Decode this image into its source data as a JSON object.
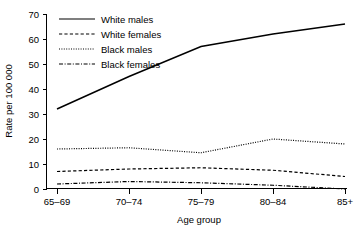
{
  "chart_data": {
    "type": "line",
    "title": "",
    "xlabel": "Age group",
    "ylabel": "Rate per 100 000",
    "categories": [
      "65–69",
      "70–74",
      "75–79",
      "80–84",
      "85+"
    ],
    "xtick_labels": [
      "65–69",
      "70–74",
      "75–79",
      "80–84",
      "85+"
    ],
    "ytick_labels": [
      "0",
      "10",
      "20",
      "30",
      "40",
      "50",
      "60",
      "70"
    ],
    "ytick_values": [
      0,
      10,
      20,
      30,
      40,
      50,
      60,
      70
    ],
    "ylim": [
      0,
      70
    ],
    "grid": false,
    "legend_position": "upper-left-inside",
    "series": [
      {
        "name": "White males",
        "style": "solid",
        "color": "#000000",
        "values": [
          32,
          45,
          57,
          62,
          66
        ]
      },
      {
        "name": "White females",
        "style": "dashed",
        "color": "#000000",
        "values": [
          7,
          8,
          8.5,
          7.5,
          5
        ]
      },
      {
        "name": "Black males",
        "style": "dotted",
        "color": "#000000",
        "values": [
          16,
          16.5,
          14.5,
          20,
          18
        ]
      },
      {
        "name": "Black females",
        "style": "dash-dot",
        "color": "#000000",
        "values": [
          2,
          3,
          2.5,
          1.5,
          0
        ]
      }
    ]
  },
  "legend": {
    "entries": [
      {
        "label": "White males"
      },
      {
        "label": "White females"
      },
      {
        "label": "Black males"
      },
      {
        "label": "Black females"
      }
    ]
  },
  "axes": {
    "x_title": "Age group",
    "y_title": "Rate per 100 000"
  }
}
